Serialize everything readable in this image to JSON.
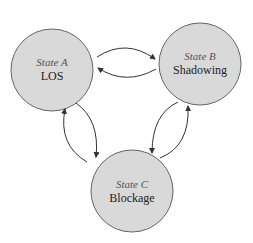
{
  "diagram": {
    "type": "state-transition",
    "colors": {
      "node_fill": "#d9d9d9",
      "node_stroke": "#666666",
      "edge": "#333333"
    },
    "nodes": [
      {
        "id": "A",
        "state_label": "State A",
        "name": "LOS",
        "cx": 52,
        "cy": 70,
        "r": 41
      },
      {
        "id": "B",
        "state_label": "State B",
        "name": "Shadowing",
        "cx": 200,
        "cy": 64,
        "r": 41
      },
      {
        "id": "C",
        "state_label": "State C",
        "name": "Blockage",
        "cx": 132,
        "cy": 191,
        "r": 41
      }
    ],
    "edges": [
      {
        "from": "A",
        "to": "B"
      },
      {
        "from": "B",
        "to": "A"
      },
      {
        "from": "A",
        "to": "C"
      },
      {
        "from": "C",
        "to": "A"
      },
      {
        "from": "B",
        "to": "C"
      },
      {
        "from": "C",
        "to": "B"
      }
    ]
  }
}
